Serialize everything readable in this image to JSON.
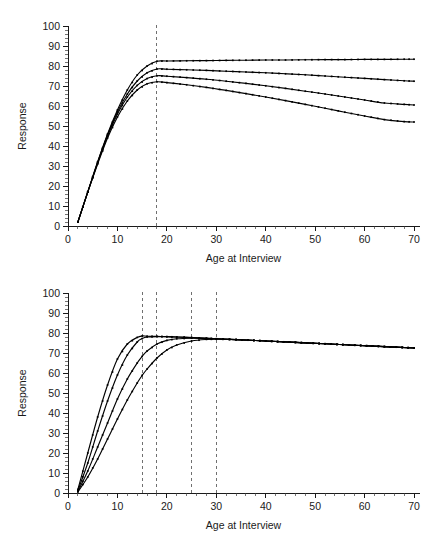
{
  "figure": {
    "panels": [
      {
        "id": "top",
        "axis": {
          "xlabel": "Age at Interview",
          "ylabel": "Response",
          "xticks": [
            0,
            10,
            20,
            30,
            40,
            50,
            60,
            70
          ],
          "yticks": [
            0,
            10,
            20,
            30,
            40,
            50,
            60,
            70,
            80,
            90,
            100
          ],
          "xlim": [
            0,
            71
          ],
          "ylim": [
            0,
            100
          ],
          "xminor_step": 2,
          "yminor_step": 2
        }
      },
      {
        "id": "bottom",
        "axis": {
          "xlabel": "Age at Interview",
          "ylabel": "Response",
          "xticks": [
            0,
            10,
            20,
            30,
            40,
            50,
            60,
            70
          ],
          "yticks": [
            0,
            10,
            20,
            30,
            40,
            50,
            60,
            70,
            80,
            90,
            100
          ],
          "xlim": [
            0,
            71
          ],
          "ylim": [
            0,
            100
          ],
          "xminor_step": 2,
          "yminor_step": 2
        }
      }
    ]
  },
  "chart_data": [
    {
      "type": "line",
      "panel": "top",
      "title": "",
      "xlabel": "Age at Interview",
      "ylabel": "Response",
      "xlim": [
        0,
        71
      ],
      "ylim": [
        0,
        100
      ],
      "xticks": [
        0,
        10,
        20,
        30,
        40,
        50,
        60,
        70
      ],
      "yticks": [
        0,
        10,
        20,
        30,
        40,
        50,
        60,
        70,
        80,
        90,
        100
      ],
      "grid": false,
      "legend": "none",
      "markers": "small-square",
      "annotations": [
        {
          "type": "vline",
          "x": 18,
          "style": "dashed",
          "color": "#707070"
        }
      ],
      "x": [
        2,
        4,
        6,
        8,
        10,
        12,
        14,
        16,
        18,
        20,
        24,
        28,
        32,
        36,
        40,
        44,
        48,
        52,
        56,
        60,
        64,
        68,
        70
      ],
      "series": [
        {
          "name": "curve-1",
          "values": [
            2.0,
            17.0,
            32.0,
            46.0,
            58.0,
            68.0,
            75.5,
            80.0,
            82.4,
            82.5,
            82.6,
            82.7,
            82.8,
            82.9,
            83.0,
            83.0,
            83.1,
            83.2,
            83.2,
            83.3,
            83.3,
            83.4,
            83.4
          ]
        },
        {
          "name": "curve-2",
          "values": [
            2.0,
            17.0,
            32.0,
            45.5,
            57.0,
            66.0,
            72.5,
            76.6,
            78.5,
            78.4,
            78.1,
            77.8,
            77.4,
            77.0,
            76.6,
            76.1,
            75.6,
            75.0,
            74.4,
            73.8,
            73.2,
            72.6,
            72.4
          ]
        },
        {
          "name": "curve-3",
          "values": [
            2.0,
            17.0,
            31.5,
            45.0,
            56.0,
            64.5,
            70.3,
            73.7,
            75.1,
            74.9,
            74.2,
            73.4,
            72.4,
            71.3,
            70.1,
            68.8,
            67.4,
            66.0,
            64.5,
            63.0,
            61.5,
            60.8,
            60.5
          ]
        },
        {
          "name": "curve-4",
          "values": [
            2.0,
            17.0,
            31.0,
            44.0,
            54.5,
            62.5,
            68.0,
            71.1,
            72.1,
            71.7,
            70.6,
            69.3,
            67.8,
            66.2,
            64.5,
            62.7,
            60.8,
            58.9,
            56.9,
            55.0,
            53.2,
            52.2,
            52.0
          ]
        }
      ]
    },
    {
      "type": "line",
      "panel": "bottom",
      "title": "",
      "xlabel": "Age at Interview",
      "ylabel": "Response",
      "xlim": [
        0,
        71
      ],
      "ylim": [
        0,
        100
      ],
      "xticks": [
        0,
        10,
        20,
        30,
        40,
        50,
        60,
        70
      ],
      "yticks": [
        0,
        10,
        20,
        30,
        40,
        50,
        60,
        70,
        80,
        90,
        100
      ],
      "grid": false,
      "legend": "none",
      "markers": "small-square",
      "annotations": [
        {
          "type": "vline",
          "x": 15,
          "style": "dashed",
          "color": "#707070"
        },
        {
          "type": "vline",
          "x": 18,
          "style": "dashed",
          "color": "#707070"
        },
        {
          "type": "vline",
          "x": 25,
          "style": "dashed",
          "color": "#707070"
        },
        {
          "type": "vline",
          "x": 30,
          "style": "dashed",
          "color": "#707070"
        }
      ],
      "x": [
        2,
        4,
        6,
        8,
        10,
        12,
        14,
        15,
        16,
        18,
        20,
        22,
        25,
        28,
        30,
        34,
        40,
        46,
        52,
        58,
        64,
        70
      ],
      "series": [
        {
          "name": "curve-15",
          "values": [
            1.8,
            20.0,
            38.0,
            54.0,
            67.0,
            74.5,
            77.8,
            78.5,
            78.4,
            78.3,
            78.2,
            78.0,
            77.7,
            77.3,
            77.1,
            76.7,
            76.0,
            75.3,
            74.6,
            73.9,
            73.2,
            72.5
          ]
        },
        {
          "name": "curve-18",
          "values": [
            1.2,
            15.0,
            31.0,
            46.0,
            59.0,
            69.0,
            75.5,
            77.2,
            78.0,
            78.2,
            78.1,
            78.0,
            77.7,
            77.3,
            77.1,
            76.7,
            76.0,
            75.3,
            74.6,
            73.9,
            73.2,
            72.5
          ]
        },
        {
          "name": "curve-25",
          "values": [
            0.8,
            11.0,
            23.0,
            35.0,
            47.0,
            57.0,
            65.0,
            68.3,
            71.0,
            74.5,
            76.3,
            77.1,
            77.4,
            77.3,
            77.1,
            76.7,
            76.0,
            75.3,
            74.6,
            73.9,
            73.2,
            72.5
          ]
        },
        {
          "name": "curve-30",
          "values": [
            0.5,
            8.0,
            17.0,
            27.0,
            37.0,
            46.5,
            55.0,
            58.8,
            62.0,
            67.5,
            71.5,
            74.0,
            76.0,
            76.8,
            76.9,
            76.7,
            76.0,
            75.3,
            74.6,
            73.9,
            73.2,
            72.5
          ]
        }
      ]
    }
  ]
}
